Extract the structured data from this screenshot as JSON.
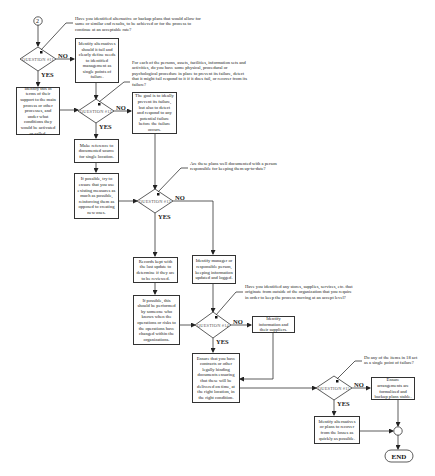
{
  "diagram": {
    "start_connector": "2",
    "end_label": "END",
    "yes_label": "YES",
    "no_label": "NO",
    "questions": [
      {
        "id": "q1",
        "label": "QUESTION #11",
        "prompt": "Have you identified alternative or backup plans that would allow for same or similar end results, to be achieved or for the process to continue at an acceptable rate?"
      },
      {
        "id": "q2",
        "label": "QUESTION #12",
        "prompt": "For each of the persons, assets, facilities, information sets and activities, do you have some physical, procedural or psychological procedure in place to prevent its failure, detect that it might fail respond to it if it does fail, or recover from its failure?"
      },
      {
        "id": "q3",
        "label": "QUESTION #13",
        "prompt": "Are these plans well documented with a person responsible for keeping them up-to-date?"
      },
      {
        "id": "q4",
        "label": "QUESTION #14",
        "prompt": "Have you identified any stores, supplies, services, etc. that originate from outside of the organization that you require in order to keep the process moving at an accept level?"
      },
      {
        "id": "q5",
        "label": "QUESTION #15",
        "prompt": "Do any of the items in 18 act as a single point of failure?"
      }
    ],
    "boxes": {
      "q1_yes": "Identify this in terms of their support to the main process or other processes, and under what conditions they would be activated or called.",
      "q1_no": "Identify alternatives should it fail and clearly define needs to identified management as single points of failure.",
      "q2_no": "The goal is to ideally prevent its failure, but also to detect and respond to any potential failure before the failure occurs.",
      "q2_yes_1": "Make reference to documented source for single location.",
      "q2_yes_2": "If possible, try to ensure that you use existing measures as much as possible, reinforcing them as opposed to creating new ones.",
      "q3_yes_1": "Records kept with the last update to determine if they are to be reviewed.",
      "q3_yes_2": "If possible, this should be performed by someone who knows when the operations or risks to the operations have changed within the organizations.",
      "q3_no": "Identify manager or responsible person, keeping information updated and logged.",
      "q4_no": "Identify information and their suppliers.",
      "q4_yes": "Ensure that you have contracts or other legally binding documents ensuring that these will be delivered on time, at the right location, in the right condition.",
      "q5_no": "Ensure arrangements are formalized and backup plans stable.",
      "q5_yes": "Identify alternatives or plans to recover from the losses as quickly as possible."
    }
  }
}
